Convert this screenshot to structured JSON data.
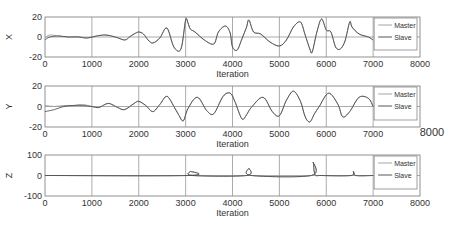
{
  "chart_data": [
    {
      "type": "line",
      "panel": "X",
      "ylabel": "X",
      "xlabel": "Iteration",
      "xlim": [
        0,
        8000
      ],
      "ylim": [
        -20,
        20
      ],
      "xticks": [
        0,
        1000,
        2000,
        3000,
        4000,
        5000,
        6000,
        7000,
        8000
      ],
      "yticks": [
        -20,
        0,
        20
      ],
      "grid": true,
      "legend": {
        "position": "upper right (inside, x 7000-8000)",
        "entries": [
          "Master",
          "Slave"
        ]
      },
      "series": [
        {
          "name": "Master",
          "x": [
            0,
            100,
            300,
            500,
            700,
            900,
            1100,
            1300,
            1500,
            1700,
            1800,
            1900,
            2000,
            2100,
            2200,
            2300,
            2450,
            2600,
            2750,
            2900,
            3000,
            3050,
            3100,
            3200,
            3400,
            3600,
            3700,
            3850,
            3950,
            4000,
            4100,
            4200,
            4300,
            4350,
            4450,
            4600,
            4800,
            5000,
            5150,
            5300,
            5450,
            5550,
            5650,
            5700,
            5800,
            5900,
            6000,
            6100,
            6200,
            6300,
            6400,
            6500,
            6550,
            6700,
            6900,
            7000
          ],
          "y": [
            -1,
            2,
            1,
            0,
            0.5,
            -1,
            1,
            2,
            0,
            -3,
            0,
            3,
            5,
            3,
            -3,
            -6,
            -1,
            9,
            -10,
            -12,
            17,
            14,
            8,
            5,
            -3,
            -7,
            5,
            11,
            4,
            -10,
            -13,
            -2,
            10,
            17,
            5,
            3,
            -5,
            -9,
            -3,
            10,
            15,
            2,
            -12,
            -15,
            5,
            18,
            7,
            5,
            -10,
            -12,
            -4,
            15,
            10,
            3,
            0,
            -3
          ]
        },
        {
          "name": "Slave",
          "x": [
            0,
            100,
            300,
            500,
            700,
            900,
            1100,
            1300,
            1500,
            1700,
            1800,
            1900,
            2000,
            2100,
            2200,
            2300,
            2450,
            2600,
            2750,
            2900,
            3000,
            3050,
            3100,
            3200,
            3400,
            3600,
            3700,
            3850,
            3950,
            4000,
            4100,
            4200,
            4300,
            4350,
            4450,
            4600,
            4800,
            5000,
            5150,
            5300,
            5450,
            5550,
            5650,
            5700,
            5800,
            5900,
            6000,
            6100,
            6200,
            6300,
            6400,
            6500,
            6550,
            6700,
            6900,
            7000
          ],
          "y": [
            -3,
            0,
            1,
            0,
            0,
            -1,
            1,
            2,
            0,
            -3,
            0,
            3,
            5,
            3,
            -3,
            -6,
            -1,
            9,
            -10,
            -12,
            17,
            14,
            8,
            5,
            -3,
            -7,
            5,
            11,
            4,
            -10,
            -13,
            -2,
            10,
            17,
            5,
            3,
            -5,
            -9,
            -3,
            10,
            15,
            2,
            -12,
            -15,
            5,
            18,
            7,
            5,
            -10,
            -12,
            -4,
            15,
            10,
            3,
            0,
            -3
          ]
        }
      ]
    },
    {
      "type": "line",
      "panel": "Y",
      "ylabel": "Y",
      "xlabel": "Iteration",
      "xlim": [
        0,
        8000
      ],
      "ylim": [
        -20,
        20
      ],
      "xticks": [
        0,
        1000,
        2000,
        3000,
        4000,
        5000,
        6000,
        7000,
        8000
      ],
      "yticks": [
        -20,
        0,
        20
      ],
      "grid": true,
      "legend": {
        "position": "upper right (inside, x 7000-8000)",
        "entries": [
          "Master",
          "Slave"
        ]
      },
      "series": [
        {
          "name": "Master",
          "x": [
            0,
            200,
            400,
            600,
            800,
            1000,
            1150,
            1350,
            1550,
            1700,
            1900,
            2000,
            2150,
            2300,
            2450,
            2600,
            2750,
            2850,
            2950,
            3050,
            3250,
            3450,
            3600,
            3800,
            3950,
            4050,
            4200,
            4300,
            4400,
            4650,
            4850,
            5000,
            5150,
            5300,
            5450,
            5550,
            5650,
            5750,
            5850,
            6050,
            6250,
            6350,
            6500,
            6700,
            6900,
            7000
          ],
          "y": [
            1,
            0,
            1,
            1,
            2,
            0,
            -1,
            3,
            -1,
            -3,
            3,
            5,
            1,
            -5,
            2,
            10,
            0,
            -8,
            -14,
            -2,
            9,
            -4,
            -7,
            10,
            13,
            5,
            -12,
            -8,
            -1,
            9,
            -5,
            -9,
            6,
            15,
            5,
            -10,
            -15,
            -7,
            0,
            13,
            2,
            -10,
            -5,
            9,
            8,
            0
          ]
        },
        {
          "name": "Slave",
          "x": [
            0,
            200,
            400,
            600,
            800,
            1000,
            1150,
            1350,
            1550,
            1700,
            1900,
            2000,
            2150,
            2300,
            2450,
            2600,
            2750,
            2850,
            2950,
            3050,
            3250,
            3450,
            3600,
            3800,
            3950,
            4050,
            4200,
            4300,
            4400,
            4650,
            4850,
            5000,
            5150,
            5300,
            5450,
            5550,
            5650,
            5750,
            5850,
            6050,
            6250,
            6350,
            6500,
            6700,
            6900,
            7000
          ],
          "y": [
            -5,
            -3,
            0,
            1,
            1,
            0,
            -1,
            3,
            -1,
            -3,
            3,
            5,
            1,
            -5,
            2,
            10,
            0,
            -8,
            -14,
            -2,
            9,
            -4,
            -7,
            10,
            13,
            5,
            -12,
            -8,
            -1,
            9,
            -5,
            -9,
            6,
            15,
            5,
            -10,
            -15,
            -7,
            0,
            13,
            2,
            -10,
            -5,
            9,
            8,
            0
          ]
        }
      ]
    },
    {
      "type": "line",
      "panel": "Z",
      "ylabel": "Z",
      "xlabel": "Iteration",
      "xlim": [
        0,
        8000
      ],
      "ylim": [
        -100,
        100
      ],
      "xticks": [
        0,
        1000,
        2000,
        3000,
        4000,
        5000,
        6000,
        7000,
        8000
      ],
      "yticks": [
        -100,
        0,
        100
      ],
      "grid": true,
      "legend": {
        "position": "upper right (inside, x 7000-8000)",
        "entries": [
          "Master",
          "Slave"
        ]
      },
      "series": [
        {
          "name": "Master",
          "x": [
            0,
            3050,
            3100,
            3150,
            4300,
            4350,
            4400,
            5680,
            5720,
            5760,
            5900,
            6530,
            6580,
            6630,
            7000
          ],
          "y": [
            0,
            0,
            20,
            0,
            0,
            35,
            0,
            0,
            65,
            5,
            0,
            0,
            20,
            0,
            0
          ]
        },
        {
          "name": "Slave",
          "x": [
            0,
            3050,
            3100,
            3150,
            4300,
            4350,
            4400,
            5680,
            5720,
            5760,
            5900,
            6530,
            6580,
            6630,
            7000
          ],
          "y": [
            0,
            0,
            20,
            0,
            0,
            35,
            0,
            0,
            65,
            5,
            0,
            0,
            20,
            0,
            0
          ]
        }
      ]
    }
  ],
  "panels": {
    "x": {
      "ylabel": "X",
      "xlabel": "Iteration",
      "yticks": [
        "20",
        "0",
        "-20"
      ],
      "xticks": [
        "0",
        "1000",
        "2000",
        "3000",
        "4000",
        "5000",
        "6000",
        "7000",
        "8000"
      ],
      "legend": [
        "Master",
        "Slave"
      ]
    },
    "y": {
      "ylabel": "Y",
      "xlabel": "Iteration",
      "yticks": [
        "20",
        "0",
        "-20"
      ],
      "xticks": [
        "0",
        "1000",
        "2000",
        "3000",
        "4000",
        "5000",
        "6000",
        "7000"
      ],
      "xtick_last": "8000",
      "legend": [
        "Master",
        "Slave"
      ]
    },
    "z": {
      "ylabel": "Z",
      "xlabel": "Iteration",
      "yticks": [
        "100",
        "0",
        "-100"
      ],
      "xticks": [
        "0",
        "1000",
        "2000",
        "3000",
        "4000",
        "5000",
        "6000",
        "7000",
        "8000"
      ],
      "legend": [
        "Master",
        "Slave"
      ]
    }
  },
  "colors": {
    "master": "#9a9a9a",
    "slave": "#444444",
    "axis": "#777777",
    "grid": "#888888"
  }
}
